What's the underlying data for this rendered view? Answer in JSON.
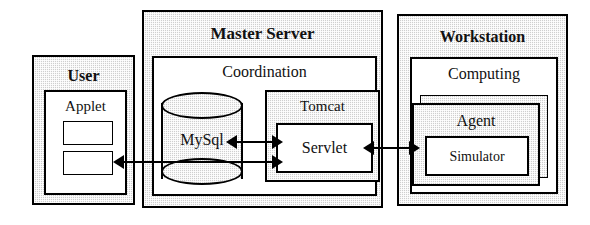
{
  "diagram": {
    "type": "block-architecture",
    "nodes": {
      "user": {
        "label": "User",
        "style": "shaded",
        "emphasis": "bold"
      },
      "applet": {
        "label": "Applet",
        "style": "white"
      },
      "applet_field_1": {
        "label": ""
      },
      "applet_field_2": {
        "label": ""
      },
      "master_server": {
        "label": "Master Server",
        "style": "shaded",
        "emphasis": "bold"
      },
      "coordination": {
        "label": "Coordination",
        "style": "white"
      },
      "mysql": {
        "label": "MySql",
        "style": "shaded",
        "shape": "cylinder"
      },
      "tomcat": {
        "label": "Tomcat",
        "style": "shaded"
      },
      "servlet": {
        "label": "Servlet",
        "style": "white"
      },
      "workstation": {
        "label": "Workstation",
        "style": "shaded",
        "emphasis": "bold"
      },
      "computing": {
        "label": "Computing",
        "style": "white"
      },
      "agent": {
        "label": "Agent",
        "style": "shaded",
        "shape": "stacked"
      },
      "simulator": {
        "label": "Simulator",
        "style": "white"
      }
    },
    "connections": [
      {
        "from": "servlet",
        "to": "mysql",
        "direction": "bidirectional"
      },
      {
        "from": "servlet",
        "to": "applet",
        "direction": "bidirectional"
      },
      {
        "from": "servlet",
        "to": "agent",
        "direction": "bidirectional"
      }
    ],
    "colors": {
      "line": "#000000",
      "shaded_fill": "#cfcfcf",
      "white_fill": "#ffffff",
      "text": "#111111"
    }
  }
}
